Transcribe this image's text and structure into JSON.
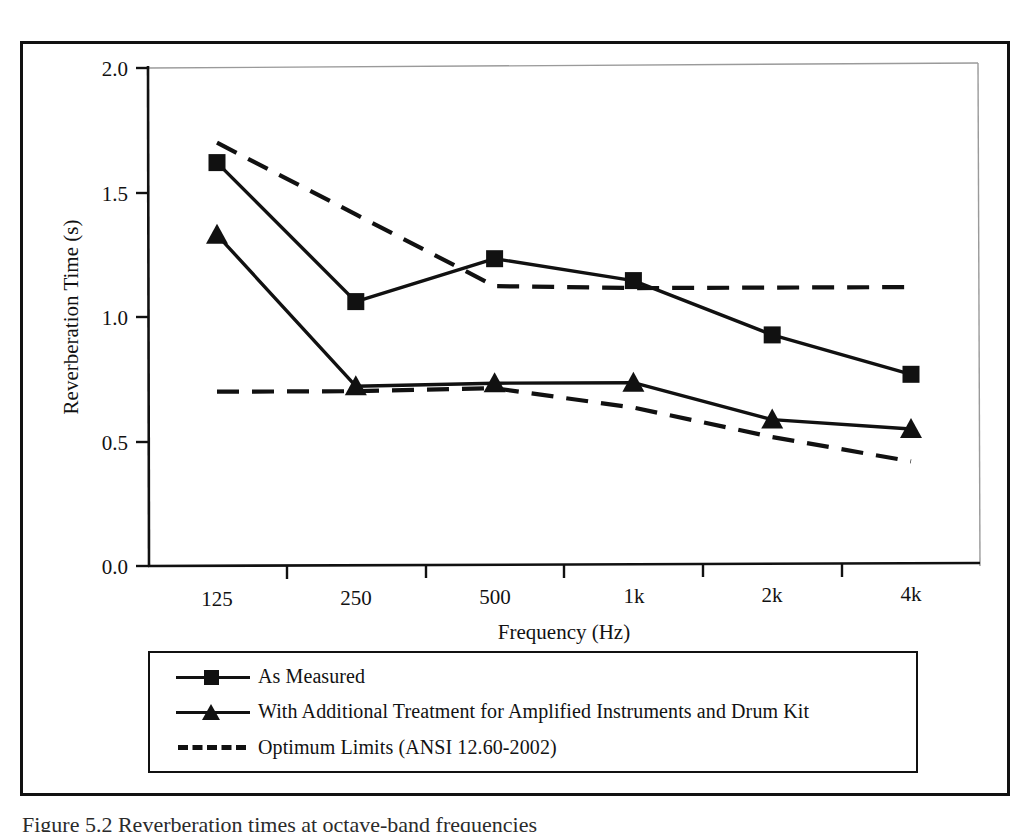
{
  "figure": {
    "caption": "Figure 5.2  Reverberation times at octave-band frequencies"
  },
  "chart_data": {
    "type": "line",
    "title": "",
    "xlabel": "Frequency (Hz)",
    "ylabel": "Reverberation Time (s)",
    "categories": [
      "125",
      "250",
      "500",
      "1k",
      "2k",
      "4k"
    ],
    "ylim": [
      0.0,
      2.0
    ],
    "yticks": [
      "0.0",
      "0.5",
      "1.0",
      "1.5",
      "2.0"
    ],
    "ytick_values": [
      0.0,
      0.5,
      1.0,
      1.5,
      2.0
    ],
    "grid": false,
    "legend_position": "below-plot",
    "series": [
      {
        "name": "As Measured",
        "marker": "square",
        "linestyle": "solid",
        "color": "#111111",
        "values": [
          1.62,
          1.06,
          1.23,
          1.14,
          0.92,
          0.76
        ]
      },
      {
        "name": "With Additional Treatment for Amplified Instruments and Drum Kit",
        "marker": "triangle",
        "linestyle": "solid",
        "color": "#111111",
        "values": [
          1.33,
          0.72,
          0.73,
          0.73,
          0.58,
          0.54
        ]
      },
      {
        "name": "Optimum Limits (ANSI 12.60-2002)",
        "marker": "none",
        "linestyle": "dashed",
        "color": "#111111",
        "upper_limit": [
          1.7,
          1.41,
          1.12,
          1.11,
          1.11,
          1.11
        ],
        "lower_limit": [
          0.7,
          0.7,
          0.71,
          0.63,
          0.51,
          0.41
        ]
      }
    ]
  },
  "legend": {
    "items": [
      {
        "label": "As Measured",
        "marker": "square",
        "linestyle": "solid"
      },
      {
        "label": "With Additional Treatment for Amplified Instruments and Drum Kit",
        "marker": "triangle",
        "linestyle": "solid"
      },
      {
        "label": "Optimum Limits (ANSI 12.60-2002)",
        "marker": "none",
        "linestyle": "dashed"
      }
    ]
  },
  "colors": {
    "ink": "#111111",
    "paper": "#ffffff",
    "plot_border": "#8c8c8c"
  }
}
